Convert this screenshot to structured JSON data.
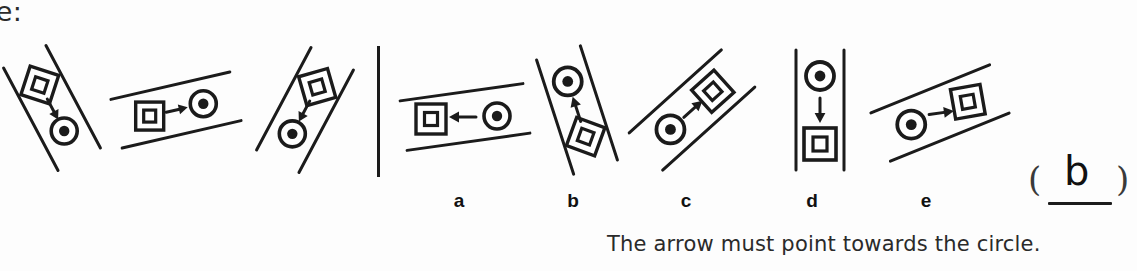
{
  "heading_fragment": "ple:",
  "caption": "The arrow must point towards the circle.",
  "answer": {
    "left_paren": "(",
    "right_paren": ")",
    "letter": "b"
  },
  "stem": {
    "figures": [
      {
        "name": "stem-figure-1",
        "rail_angle_deg": -62,
        "from_shape": "square",
        "to_shape": "circle",
        "arrow_direction": "down-right"
      },
      {
        "name": "stem-figure-2",
        "rail_angle_deg": -13,
        "from_shape": "square",
        "to_shape": "circle",
        "arrow_direction": "right"
      },
      {
        "name": "stem-figure-3",
        "rail_angle_deg": 62,
        "from_shape": "square",
        "to_shape": "circle",
        "arrow_direction": "down-left"
      }
    ]
  },
  "options": [
    {
      "label": "a",
      "name": "option-a",
      "rail_angle_deg": -8,
      "from_shape": "circle",
      "to_shape": "square",
      "arrow_direction": "left"
    },
    {
      "label": "b",
      "name": "option-b",
      "rail_angle_deg": -72,
      "from_shape": "square",
      "to_shape": "circle",
      "arrow_direction": "up-left"
    },
    {
      "label": "c",
      "name": "option-c",
      "rail_angle_deg": -42,
      "from_shape": "circle",
      "to_shape": "square",
      "arrow_direction": "up-right"
    },
    {
      "label": "d",
      "name": "option-d",
      "rail_angle_deg": 90,
      "from_shape": "circle",
      "to_shape": "square",
      "arrow_direction": "down"
    },
    {
      "label": "e",
      "name": "option-e",
      "rail_angle_deg": -22,
      "from_shape": "circle",
      "to_shape": "square",
      "arrow_direction": "right"
    }
  ],
  "colors": {
    "ink": "#1b1b1b",
    "paper": "#fdfdfd",
    "text": "#2a2a2a"
  }
}
